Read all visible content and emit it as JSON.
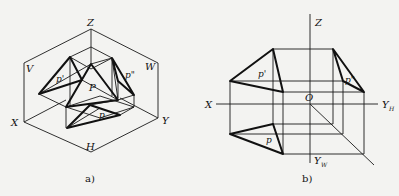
{
  "figure_a": {
    "caption": "a)",
    "labels": {
      "z": "Z",
      "v": "V",
      "w": "W",
      "x": "X",
      "y": "Y",
      "h": "H",
      "p": "P",
      "p_front": "p'",
      "p_side": "p\"",
      "p_top": "p"
    }
  },
  "figure_b": {
    "caption": "b)",
    "labels": {
      "z": "Z",
      "x": "X",
      "o": "O",
      "yh": "Y",
      "yh_sub": "H",
      "yw": "Y",
      "yw_sub": "W",
      "p_front": "p'",
      "p_side": "p\"",
      "p_top": "p"
    }
  },
  "colors": {
    "background": "#f3f3f1",
    "line": "#111111"
  }
}
